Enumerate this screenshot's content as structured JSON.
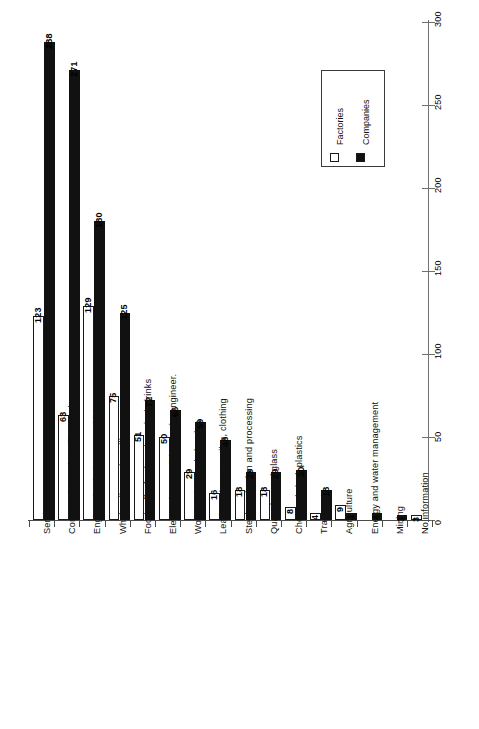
{
  "chart_data": {
    "type": "bar",
    "orientation": "rotated-vertical",
    "title": "",
    "xlabel": "",
    "ylabel": "",
    "ylim": [
      0,
      300
    ],
    "ticks": [
      0,
      50,
      100,
      150,
      200,
      250,
      300
    ],
    "grid": false,
    "legend_position": "top-right",
    "categories": [
      "Services",
      "Construction and ancillary trades",
      "Engineering incl. motor vehicles",
      "Wholesaling and retailing",
      "Foodstuffs, food products incl. drinks",
      "Electronics, precision, optic. engineer.",
      "Wood and paper industries",
      "Leather, shoes, textiles, clothing",
      "Steel production and processing",
      "Quarrying and glass",
      "Chemicals incl. plastics",
      "Transport",
      "Agriculture",
      "Energy and water management",
      "Mining",
      "No information"
    ],
    "series": [
      {
        "name": "Factories",
        "color": "#ffffff",
        "values": [
          123,
          63,
          129,
          75,
          51,
          50,
          29,
          16,
          18,
          18,
          8,
          4,
          9,
          null,
          null,
          3
        ]
      },
      {
        "name": "Companies",
        "color": "#111111",
        "values": [
          288,
          271,
          180,
          125,
          72,
          66,
          59,
          48,
          29,
          29,
          30,
          18,
          4,
          4,
          3,
          null
        ]
      }
    ]
  },
  "legend": {
    "entries": [
      {
        "label": "Factories",
        "swatch": "hollow-square-icon"
      },
      {
        "label": "Companies",
        "swatch": "filled-square-icon"
      }
    ]
  }
}
